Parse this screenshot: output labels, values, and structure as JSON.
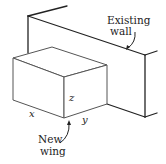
{
  "figure": {
    "labels": {
      "existing_wall_line1": "Existing",
      "existing_wall_line2": "wall",
      "new_wing_line1": "New",
      "new_wing_line2": "wing",
      "x": "x",
      "y": "y",
      "z": "z"
    },
    "colors": {
      "wall_stroke": "#222222",
      "box_stroke": "#555555",
      "background": "#ffffff"
    }
  }
}
